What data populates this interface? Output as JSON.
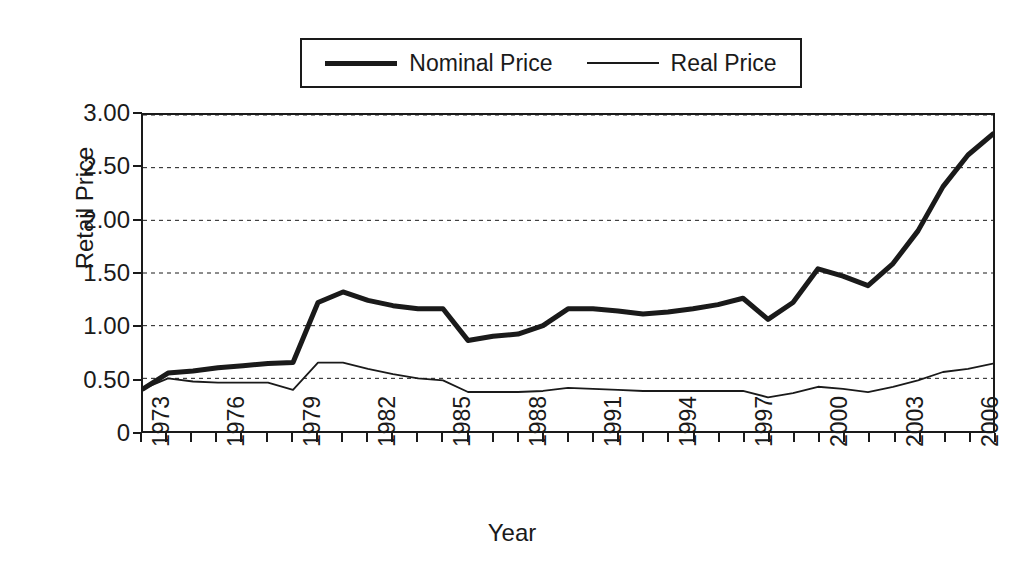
{
  "chart_data": {
    "type": "line",
    "title": "",
    "xlabel": "Year",
    "ylabel": "Retail Price",
    "xlim": [
      1973,
      2007
    ],
    "ylim": [
      0,
      3.0
    ],
    "grid": "horizontal-dashed",
    "legend_position": "top-center",
    "y_ticks": [
      "0",
      "0.50",
      "1.00",
      "1.50",
      "2.00",
      "2.50",
      "3.00"
    ],
    "y_tick_values": [
      0,
      0.5,
      1.0,
      1.5,
      2.0,
      2.5,
      3.0
    ],
    "x_tick_labels": [
      "1973",
      "1976",
      "1979",
      "1982",
      "1985",
      "1988",
      "1991",
      "1994",
      "1997",
      "2000",
      "2003",
      "2006"
    ],
    "x_tick_values": [
      1973,
      1976,
      1979,
      1982,
      1985,
      1988,
      1991,
      1994,
      1997,
      2000,
      2003,
      2006
    ],
    "x": [
      1973,
      1974,
      1975,
      1976,
      1977,
      1978,
      1979,
      1980,
      1981,
      1982,
      1983,
      1984,
      1985,
      1986,
      1987,
      1988,
      1989,
      1990,
      1991,
      1992,
      1993,
      1994,
      1995,
      1996,
      1997,
      1998,
      1999,
      2000,
      2001,
      2002,
      2003,
      2004,
      2005,
      2006,
      2007
    ],
    "series": [
      {
        "name": "Nominal Price",
        "style": "thick",
        "color": "#1a1a1a",
        "values": [
          0.4,
          0.55,
          0.57,
          0.6,
          0.62,
          0.64,
          0.65,
          1.22,
          1.32,
          1.24,
          1.19,
          1.16,
          1.16,
          0.86,
          0.9,
          0.92,
          1.0,
          1.16,
          1.16,
          1.14,
          1.11,
          1.13,
          1.16,
          1.2,
          1.26,
          1.06,
          1.22,
          1.54,
          1.47,
          1.38,
          1.59,
          1.9,
          2.32,
          2.62,
          2.82
        ]
      },
      {
        "name": "Real Price",
        "style": "thin",
        "color": "#1a1a1a",
        "values": [
          0.4,
          0.5,
          0.47,
          0.46,
          0.46,
          0.46,
          0.39,
          0.65,
          0.65,
          0.59,
          0.54,
          0.5,
          0.48,
          0.37,
          0.37,
          0.37,
          0.38,
          0.41,
          0.4,
          0.39,
          0.38,
          0.38,
          0.38,
          0.38,
          0.38,
          0.32,
          0.36,
          0.42,
          0.4,
          0.37,
          0.42,
          0.48,
          0.56,
          0.59,
          0.64
        ]
      }
    ]
  },
  "legend": {
    "items": [
      {
        "label": "Nominal Price",
        "swatch": "thick-line-swatch"
      },
      {
        "label": "Real Price",
        "swatch": "thin-line-swatch"
      }
    ]
  }
}
